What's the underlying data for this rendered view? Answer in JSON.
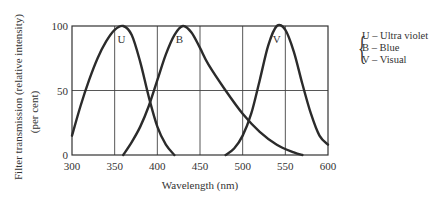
{
  "chart_data": {
    "type": "line",
    "title": "",
    "xlabel": "Wavelength (nm)",
    "ylabel": "Filter transmission (relative intensity) (per cent)",
    "ylabel_line1": "Filter transmission (relative intensity)",
    "ylabel_line2": "(per cent)",
    "xlim": [
      300,
      600
    ],
    "ylim": [
      0,
      100
    ],
    "xticks": [
      300,
      350,
      400,
      450,
      500,
      550,
      600
    ],
    "yticks": [
      0,
      50,
      100
    ],
    "grid": true,
    "legend_position": "right",
    "series": [
      {
        "name": "U",
        "label": "U – Ultra violet",
        "x": [
          300,
          310,
          320,
          330,
          340,
          350,
          360,
          370,
          380,
          390,
          400,
          410,
          420
        ],
        "y": [
          15,
          38,
          58,
          75,
          88,
          97,
          100,
          93,
          72,
          45,
          22,
          8,
          0
        ]
      },
      {
        "name": "B",
        "label": "B – Blue",
        "x": [
          360,
          370,
          380,
          390,
          400,
          410,
          420,
          430,
          440,
          450,
          460,
          480,
          500,
          520,
          540,
          560,
          570
        ],
        "y": [
          0,
          10,
          22,
          38,
          58,
          78,
          93,
          100,
          95,
          83,
          70,
          50,
          32,
          18,
          8,
          2,
          0
        ]
      },
      {
        "name": "V",
        "label": "V – Visual",
        "x": [
          480,
          490,
          500,
          510,
          520,
          530,
          540,
          550,
          560,
          570,
          580,
          590,
          600
        ],
        "y": [
          0,
          5,
          15,
          32,
          58,
          85,
          100,
          97,
          80,
          55,
          32,
          15,
          8
        ]
      }
    ],
    "annotations": [
      {
        "text": "U",
        "x": 358,
        "y": 90
      },
      {
        "text": "B",
        "x": 426,
        "y": 90
      },
      {
        "text": "V",
        "x": 540,
        "y": 90
      }
    ]
  },
  "legend": {
    "items": [
      "U – Ultra violet",
      "B – Blue",
      "V – Visual"
    ]
  }
}
